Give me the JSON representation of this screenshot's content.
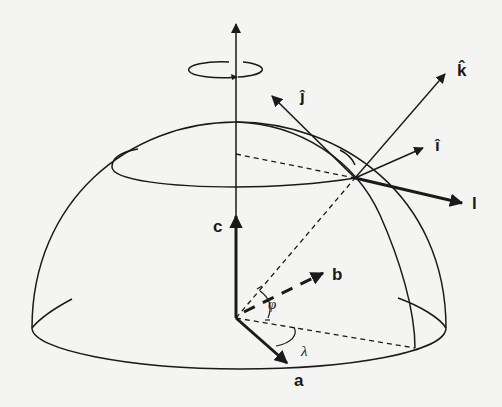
{
  "diagram": {
    "background": "#f4f4f2",
    "stroke_color": "#1a1a1a",
    "labels": {
      "j_hat": "ĵ",
      "k_hat": "k̂",
      "i_hat": "î",
      "l": "l",
      "c": "c",
      "b": "b",
      "a": "a",
      "phi": "φ",
      "lambda": "λ"
    },
    "elements": [
      {
        "name": "rotation-axis",
        "type": "arrow",
        "style": "solid"
      },
      {
        "name": "rotation-indicator",
        "type": "ellipse-arrow"
      },
      {
        "name": "hemisphere-outline",
        "type": "dome"
      },
      {
        "name": "base-ellipse",
        "type": "ellipse"
      },
      {
        "name": "latitude-circle",
        "type": "ellipse"
      },
      {
        "name": "meridian",
        "type": "arc"
      },
      {
        "name": "vector-j-hat",
        "type": "arrow"
      },
      {
        "name": "vector-k-hat",
        "type": "arrow"
      },
      {
        "name": "vector-i-hat",
        "type": "arrow"
      },
      {
        "name": "vector-l",
        "type": "arrow",
        "style": "thick"
      },
      {
        "name": "vector-c",
        "type": "arrow",
        "style": "thick"
      },
      {
        "name": "vector-b",
        "type": "arrow",
        "style": "thick-dashed"
      },
      {
        "name": "vector-a",
        "type": "arrow",
        "style": "thick"
      },
      {
        "name": "angle-phi",
        "type": "angle-arc"
      },
      {
        "name": "angle-lambda",
        "type": "angle-arc"
      }
    ]
  }
}
